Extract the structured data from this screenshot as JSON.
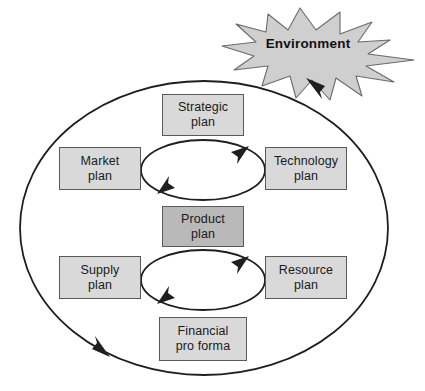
{
  "diagram": {
    "environment": {
      "label": "Environment",
      "shape": "starburst",
      "fill": "#cfcfcf",
      "stroke": "#6b6b6b"
    },
    "colors": {
      "box_fill_light": "#d9d9d9",
      "box_fill_dark": "#b9b9b9",
      "box_stroke": "#5a5a5a",
      "line": "#1f1f1f",
      "text": "#1a1a1a",
      "background": "#ffffff"
    },
    "outer_cycle": {
      "name": "outer-ellipse",
      "direction": "counterclockwise",
      "arrowheads": 2
    },
    "inner_cycles": [
      {
        "name": "upper-inner-ellipse",
        "direction": "clockwise",
        "arrowheads": 2
      },
      {
        "name": "lower-inner-ellipse",
        "direction": "clockwise",
        "arrowheads": 2
      }
    ],
    "nodes": [
      {
        "id": "strategic",
        "line1": "Strategic",
        "line2": "plan",
        "emphasis": false
      },
      {
        "id": "market",
        "line1": "Market",
        "line2": "plan",
        "emphasis": false
      },
      {
        "id": "technology",
        "line1": "Technology",
        "line2": "plan",
        "emphasis": false
      },
      {
        "id": "product",
        "line1": "Product",
        "line2": "plan",
        "emphasis": true
      },
      {
        "id": "supply",
        "line1": "Supply",
        "line2": "plan",
        "emphasis": false
      },
      {
        "id": "resource",
        "line1": "Resource",
        "line2": "plan",
        "emphasis": false
      },
      {
        "id": "financial",
        "line1": "Financial",
        "line2": "pro forma",
        "emphasis": false
      }
    ]
  }
}
